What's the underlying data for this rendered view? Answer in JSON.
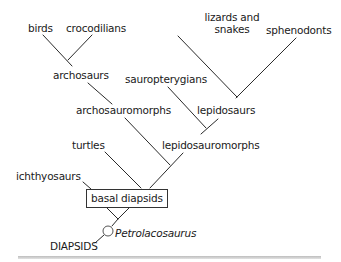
{
  "diagram": {
    "type": "cladogram",
    "root_label": "DIAPSIDS",
    "root_taxon": "Petrolacosaurus",
    "boxed_node": "basal diapsids",
    "terminal_taxa": {
      "birds": "birds",
      "crocodilians": "crocodilians",
      "lizards_snakes_line1": "lizards and",
      "lizards_snakes_line2": "snakes",
      "sphenodonts": "sphenodonts",
      "sauropterygians": "sauropterygians",
      "turtles": "turtles",
      "ichthyosaurs": "ichthyosaurs"
    },
    "internal_nodes": {
      "archosaurs": "archosaurs",
      "archosauromorphs": "archosauromorphs",
      "lepidosaurs": "lepidosaurs",
      "lepidosauromorphs": "lepidosauromorphs"
    },
    "colors": {
      "line": "#2a2a2a",
      "text": "#1a1a1a",
      "background": "#ffffff",
      "rule": "#c8c8c8"
    }
  }
}
